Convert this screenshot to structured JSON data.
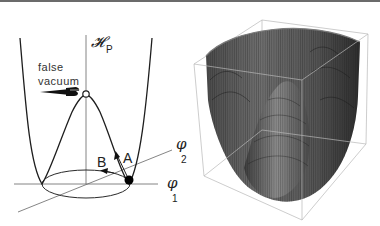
{
  "figure": {
    "left_panel": {
      "title": "Higgs-like potential with false vacuum (schematic)",
      "vertical_axis_label": "𝓗",
      "vertical_axis_subscript": "P",
      "horizontal_axis_1_label": "φ",
      "horizontal_axis_1_subscript": "1",
      "horizontal_axis_2_label": "φ",
      "horizontal_axis_2_subscript": "2",
      "annotation_line1": "false",
      "annotation_line2": "vacuum",
      "arrow_a_label": "A",
      "arrow_b_label": "B",
      "pointer_icon": "pointing-hand-icon",
      "colors": {
        "stroke": "#2a2a2a",
        "axis": "#555555",
        "ball": "#000000"
      }
    },
    "right_panel": {
      "title": "3D surface plot of potential (Mexican-hat shape)",
      "colors": {
        "surface_dark": "#2e2e2e",
        "surface_mid": "#6a6a6a",
        "surface_light": "#9a9a9a",
        "box": "#b5b5b5"
      }
    }
  }
}
